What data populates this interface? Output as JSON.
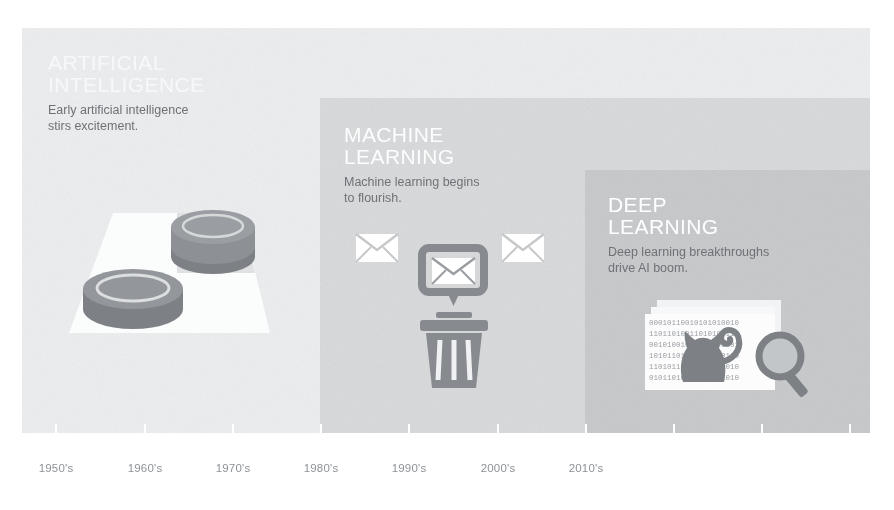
{
  "figure": {
    "background_color": "#ffffff"
  },
  "panels": [
    {
      "id": "ai",
      "heading": "ARTIFICIAL\nINTELLIGENCE",
      "caption": "Early artificial intelligence\nstirs excitement.",
      "color": "#eceef0",
      "heading_color": "#f7f8f9",
      "caption_color": "#6e7276",
      "illustration": "checkerboard-with-checkers"
    },
    {
      "id": "ml",
      "heading": "MACHINE\nLEARNING",
      "caption": "Machine learning begins\nto flourish.",
      "color": "#d9dbdd",
      "heading_color": "#fdfdfd",
      "caption_color": "#6e7276",
      "illustration": "spam-envelopes-to-trash"
    },
    {
      "id": "dl",
      "heading": "DEEP\nLEARNING",
      "caption": "Deep learning breakthroughs\ndrive AI boom.",
      "color": "#c9cbcd",
      "heading_color": "#ffffff",
      "caption_color": "#6e7276",
      "illustration": "cat-on-binary-with-magnifier"
    }
  ],
  "axis": {
    "tick_color": "#ffffff",
    "label_color": "#8e9296",
    "ticks": [
      {
        "x": 55,
        "label": "1950's"
      },
      {
        "x": 144,
        "label": "1960's"
      },
      {
        "x": 232,
        "label": "1970's"
      },
      {
        "x": 320,
        "label": "1980's"
      },
      {
        "x": 408,
        "label": "1990's"
      },
      {
        "x": 497,
        "label": "2000's"
      },
      {
        "x": 585,
        "label": "2010's"
      },
      {
        "x": 673,
        "label": ""
      },
      {
        "x": 761,
        "label": ""
      },
      {
        "x": 849,
        "label": ""
      }
    ]
  },
  "illustration_details": {
    "checkers": {
      "board_color": "#fbfcfc",
      "dark_square_color": "#d7d9db",
      "piece_color": "#8d9195"
    },
    "spam": {
      "envelope_color": "#ffffff",
      "frame_color": "#8d9195",
      "trash_color": "#8d9195"
    },
    "deep": {
      "card_color": "#fbfcfc",
      "binary_text": "0010110010101010010",
      "cat_color": "#8d9195",
      "magnifier_color": "#8d9195"
    }
  }
}
